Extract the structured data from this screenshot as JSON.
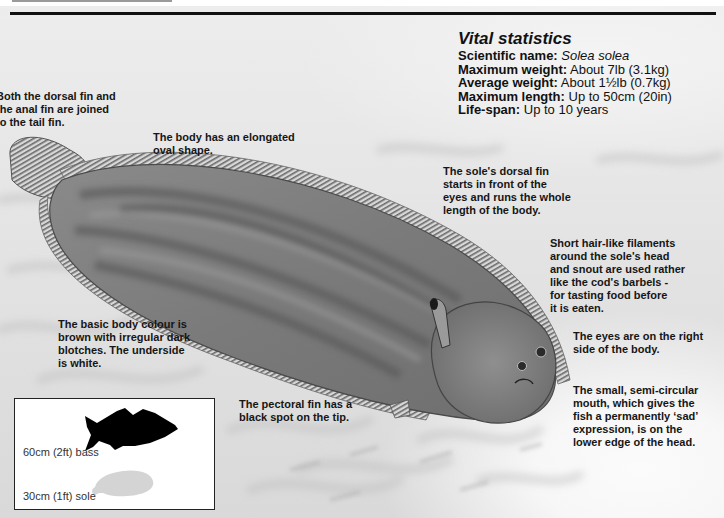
{
  "vital_statistics": {
    "title": "Vital statistics",
    "rows": [
      {
        "label": "Scientific name:",
        "value": "Solea solea",
        "italic": true
      },
      {
        "label": "Maximum weight:",
        "value": "About 7lb (3.1kg)"
      },
      {
        "label": "Average weight:",
        "value": "About 1½lb (0.7kg)"
      },
      {
        "label": "Maximum length:",
        "value": "Up to 50cm (20in)"
      },
      {
        "label": "Life-span:",
        "value": "Up to 10 years"
      }
    ]
  },
  "annotations": {
    "fins_joined": [
      "Both the dorsal fin and",
      "the anal fin are joined",
      "to the tail fin."
    ],
    "body_shape": [
      "The body has an elongated",
      "oval shape."
    ],
    "dorsal_fin": [
      "The sole's dorsal fin",
      "starts in front of the",
      "eyes and runs the whole",
      "length of the body."
    ],
    "filaments": [
      "Short hair-like filaments",
      "around the sole's head",
      "and snout are used rather",
      "like the cod's barbels -",
      "for tasting food before",
      "it is eaten."
    ],
    "body_colour": [
      "The basic body colour is",
      "brown with irregular dark",
      "blotches. The underside",
      "is white."
    ],
    "eyes": [
      "The eyes are on the right",
      "side of the body."
    ],
    "pectoral_fin": [
      "The pectoral fin has a",
      "black spot on the tip."
    ],
    "mouth": [
      "The small, semi-circular",
      "mouth, which gives the",
      "fish a permanently ‘sad’",
      "expression, is on the",
      "lower edge of the head."
    ]
  },
  "size_comparison": {
    "bass_label": "60cm (2ft) bass",
    "sole_label": "30cm (1ft) sole",
    "bass_color": "#000000",
    "sole_color": "#d4d4d4"
  }
}
